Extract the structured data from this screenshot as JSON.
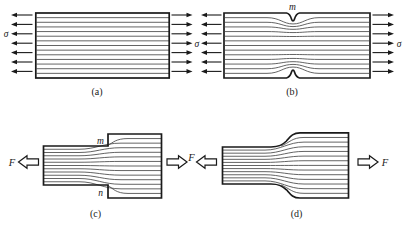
{
  "figure": {
    "type": "stress-concentration-flow-line-diagram",
    "colors": {
      "background": "#ffffff",
      "outline": "#1a1a1a",
      "flow_line": "#3c3c3c",
      "arrow": "#1a1a1a",
      "hollow_arrow_fill": "#ffffff"
    },
    "panels": {
      "a": {
        "caption": "(a)",
        "left_stress_label": "σ",
        "flow_line_count": 13,
        "arrow_count_per_side": 7
      },
      "b": {
        "caption": "(b)",
        "right_stress_label": "σ",
        "top_notch_label": "m",
        "flow_line_count": 13,
        "arrow_count_per_side": 7
      },
      "middle_stress_label": "σ",
      "c": {
        "caption": "(c)",
        "left_force_label": "F",
        "corner_top_label": "m",
        "corner_bottom_label": "n"
      },
      "middle_force_label": "F",
      "d": {
        "caption": "(d)",
        "right_force_label": "F"
      }
    }
  }
}
